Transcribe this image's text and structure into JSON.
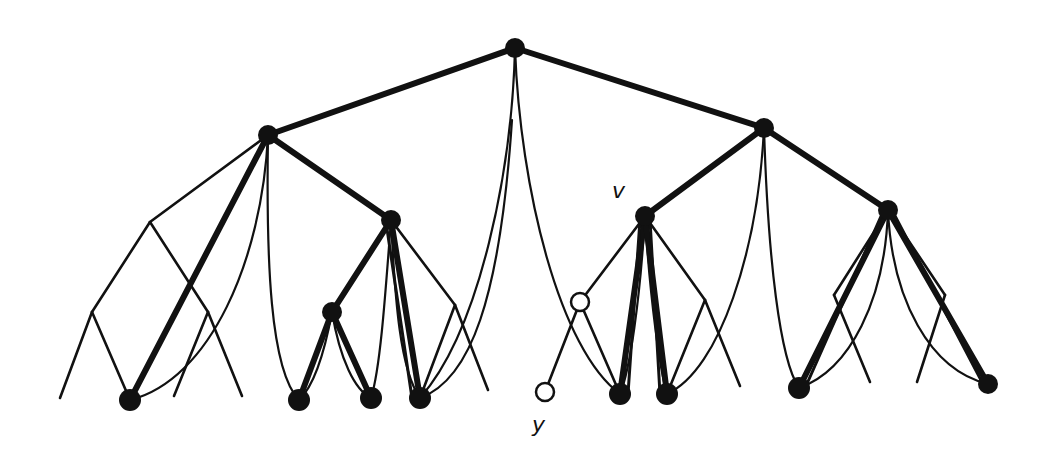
{
  "diagram": {
    "type": "tree-with-curved-back-edges",
    "colors": {
      "ink": "#111111",
      "background": "#ffffff"
    },
    "labels": {
      "v": "v",
      "y": "y"
    },
    "nodes": [
      {
        "id": "root",
        "x": 515,
        "y": 48,
        "kind": "filled"
      },
      {
        "id": "L",
        "x": 268,
        "y": 135,
        "kind": "filled"
      },
      {
        "id": "R",
        "x": 764,
        "y": 128,
        "kind": "filled"
      },
      {
        "id": "LR",
        "x": 391,
        "y": 220,
        "kind": "filled"
      },
      {
        "id": "v",
        "x": 645,
        "y": 216,
        "kind": "filled"
      },
      {
        "id": "RR",
        "x": 888,
        "y": 210,
        "kind": "filled"
      },
      {
        "id": "LRL",
        "x": 332,
        "y": 312,
        "kind": "filled"
      },
      {
        "id": "leaf1",
        "x": 130,
        "y": 400,
        "kind": "filled"
      },
      {
        "id": "leaf2",
        "x": 299,
        "y": 400,
        "kind": "filled"
      },
      {
        "id": "leaf3",
        "x": 371,
        "y": 398,
        "kind": "filled"
      },
      {
        "id": "leaf4",
        "x": 420,
        "y": 398,
        "kind": "filled"
      },
      {
        "id": "leaf5",
        "x": 620,
        "y": 394,
        "kind": "filled"
      },
      {
        "id": "leaf6",
        "x": 667,
        "y": 394,
        "kind": "filled"
      },
      {
        "id": "leaf7",
        "x": 799,
        "y": 388,
        "kind": "filled"
      },
      {
        "id": "leaf8",
        "x": 988,
        "y": 384,
        "kind": "filled"
      },
      {
        "id": "hollow1",
        "x": 580,
        "y": 302,
        "kind": "hollow"
      },
      {
        "id": "y",
        "x": 545,
        "y": 392,
        "kind": "hollow"
      }
    ]
  }
}
